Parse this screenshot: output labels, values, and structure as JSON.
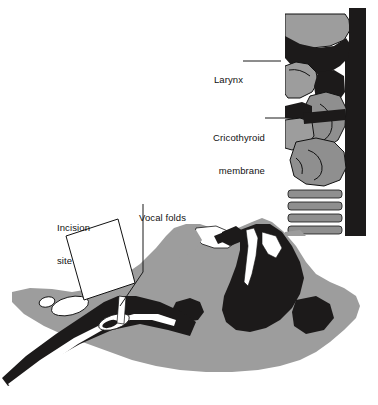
{
  "figure": {
    "width": 378,
    "height": 405,
    "background": "#ffffff"
  },
  "colors": {
    "background": "#ffffff",
    "soft_tissue_gray": "#9d9d9d",
    "cartilage_gray": "#8f8f8f",
    "airway_dark": "#1c1a1a",
    "outline": "#111111",
    "highlight_white": "#ffffff",
    "leader_line": "#1a1a1a",
    "text": "#111111"
  },
  "labels": [
    {
      "id": "larynx",
      "name": "larynx",
      "text": "Larynx",
      "lines": [
        "Larynx"
      ],
      "x": 203,
      "y": 52,
      "align": "right",
      "leader": {
        "from_x": 243,
        "from_y": 61,
        "to_x": 281,
        "to_y": 61
      }
    },
    {
      "id": "cricothyroid-membrane",
      "name": "cricothyroid-membrane",
      "text": "Cricothyroid membrane",
      "lines": [
        "Cricothyroid",
        "membrane"
      ],
      "x": 197,
      "y": 110,
      "align": "right",
      "leader": {
        "from_x": 265,
        "from_y": 118,
        "to_x": 292,
        "to_y": 118
      }
    },
    {
      "id": "vocal-folds",
      "name": "vocal-folds",
      "text": "Vocal folds",
      "lines": [
        "Vocal folds"
      ],
      "x": 139,
      "y": 190,
      "align": "left",
      "leader": {
        "from_x": 143,
        "from_y": 204,
        "to_x": 143,
        "to_y": 272,
        "to2_x": 118,
        "to2_y": 308
      }
    },
    {
      "id": "incision-site",
      "name": "incision-site",
      "text": "Incision site",
      "lines": [
        "Incision",
        "site"
      ],
      "x": 57,
      "y": 200,
      "align": "left",
      "leader": {
        "from_x": 68,
        "from_y": 226,
        "to_x": 68,
        "to_y": 226
      }
    }
  ],
  "callout_box": {
    "name": "incision-site-callout-box",
    "fill": "#ffffff",
    "stroke": "#111111",
    "points": "66,236 118,219 135,283 84,300"
  },
  "inset": {
    "name": "larynx-sagittal-inset",
    "description": "Sagittal section of larynx and upper trachea",
    "x": 285,
    "y": 8,
    "width": 93,
    "height": 228,
    "parts": [
      "epiglottis",
      "thyroid-cartilage",
      "cricothyroid-membrane",
      "cricoid-cartilage",
      "tracheal-rings",
      "vertebral-column"
    ],
    "tracheal_ring_count": 4
  },
  "main_view": {
    "name": "head-neck-sagittal-view",
    "description": "Sagittal view of head and neck in extended position showing airway",
    "parts": [
      "head-soft-tissue",
      "oral-cavity",
      "nasal-airway",
      "tongue",
      "pharynx",
      "trachea",
      "thyroid-cartilage",
      "cricoid-cartilage",
      "incision-marker"
    ]
  }
}
